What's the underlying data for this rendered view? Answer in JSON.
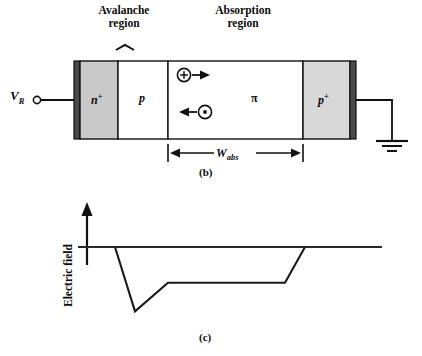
{
  "figure": {
    "panel_b": {
      "label": "(b)",
      "headings": {
        "avalanche": "Avalanche\nregion",
        "absorption": "Absorption\nregion"
      },
      "bias_terminal": {
        "symbol": "V",
        "subscript": "R"
      },
      "layers": [
        {
          "name": "n-plus",
          "label": "n",
          "superscript": "+",
          "fill": "#c9c9c9"
        },
        {
          "name": "p",
          "label": "p",
          "superscript": "",
          "fill": "#ffffff"
        },
        {
          "name": "pi",
          "label": "π",
          "superscript": "",
          "fill": "#ffffff"
        },
        {
          "name": "p-plus",
          "label": "p",
          "superscript": "+",
          "fill": "#d8d8d8"
        }
      ],
      "electrode_fill": "#4a4a4a",
      "carriers": [
        {
          "name": "hole",
          "glyph": "+",
          "direction": "right"
        },
        {
          "name": "electron",
          "glyph": "•",
          "direction": "left"
        }
      ],
      "dimension": {
        "label": "W",
        "subscript": "abs"
      },
      "ground_label": "ground"
    },
    "panel_c": {
      "label": "(c)",
      "y_axis_label": "Electric field"
    }
  },
  "chart_data": {
    "type": "line",
    "title": "",
    "xlabel": "",
    "ylabel": "Electric field",
    "grid": false,
    "legend": null,
    "axis_zero_line_y": 0,
    "series": [
      {
        "name": "electric-field-profile",
        "x": [
          115,
          135,
          168,
          285,
          305
        ],
        "values": [
          0,
          -92,
          -51,
          -51,
          0
        ]
      }
    ],
    "annotations": [
      {
        "name": "y-axis-arrow",
        "direction": "up"
      }
    ]
  }
}
